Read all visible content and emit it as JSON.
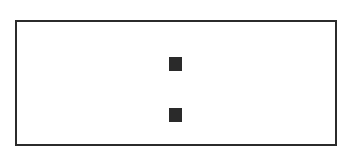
{
  "diagram": {
    "frame": {
      "stroke": "#2b2b2b",
      "fill": "#ffffff"
    },
    "marks": [
      {
        "shape": "square",
        "color": "#2a2a2a",
        "x": 169,
        "y": 57
      },
      {
        "shape": "square",
        "color": "#2a2a2a",
        "x": 169,
        "y": 108
      }
    ]
  }
}
